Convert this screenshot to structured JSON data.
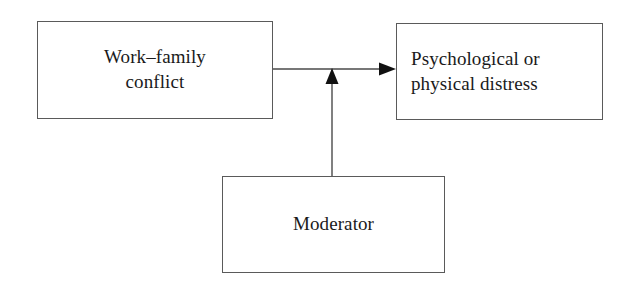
{
  "diagram": {
    "type": "moderation-model",
    "background_color": "#ffffff",
    "line_color": "#4a4a4a",
    "nodes": [
      {
        "id": "predictor",
        "label": "Work–family\nconflict",
        "text_align": "center"
      },
      {
        "id": "outcome",
        "label": "Psychological or\nphysical distress",
        "text_align": "left"
      },
      {
        "id": "moderator",
        "label": "Moderator",
        "text_align": "center"
      }
    ],
    "edges": [
      {
        "id": "predictor-to-outcome",
        "from": "predictor",
        "to": "outcome",
        "label": "",
        "arrowhead": "filled-triangle",
        "orientation": "horizontal"
      },
      {
        "id": "moderator-to-path",
        "from": "moderator",
        "to": "predictor-to-outcome",
        "label": "",
        "arrowhead": "filled-triangle",
        "orientation": "vertical"
      }
    ]
  }
}
